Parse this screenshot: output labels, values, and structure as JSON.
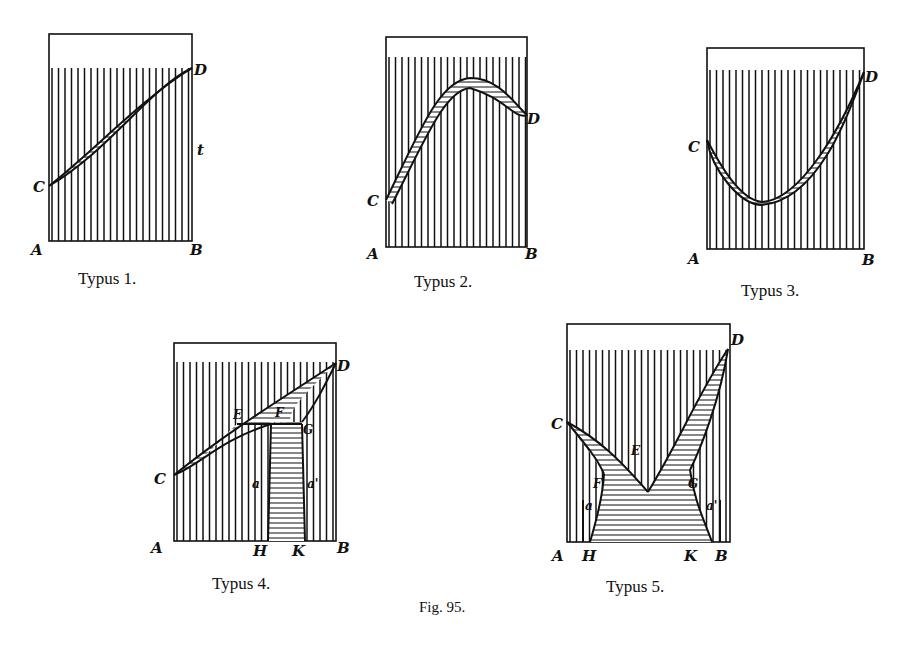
{
  "figure": {
    "title": "Fig. 95.",
    "panels": [
      {
        "id": "typus-1",
        "caption": "Typus 1.",
        "labels": {
          "A": "A",
          "B": "B",
          "C": "C",
          "D": "D",
          "t": "t"
        }
      },
      {
        "id": "typus-2",
        "caption": "Typus 2.",
        "labels": {
          "A": "A",
          "B": "B",
          "C": "C",
          "D": "D"
        }
      },
      {
        "id": "typus-3",
        "caption": "Typus 3.",
        "labels": {
          "A": "A",
          "B": "B",
          "C": "C",
          "D": "D"
        }
      },
      {
        "id": "typus-4",
        "caption": "Typus 4.",
        "labels": {
          "A": "A",
          "B": "B",
          "C": "C",
          "D": "D",
          "E": "E",
          "F": "F",
          "G": "G",
          "H": "H",
          "K": "K",
          "a": "a",
          "a2": "a'"
        }
      },
      {
        "id": "typus-5",
        "caption": "Typus 5.",
        "labels": {
          "A": "A",
          "B": "B",
          "C": "C",
          "D": "D",
          "E": "E",
          "F": "F",
          "G": "G",
          "H": "H",
          "K": "K",
          "a": "a",
          "a2": "a'"
        }
      }
    ]
  }
}
